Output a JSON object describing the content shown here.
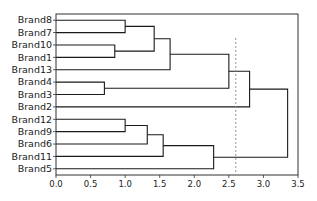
{
  "chart_data": {
    "type": "dendrogram",
    "title": "",
    "xlabel": "",
    "ylabel": "",
    "orientation": "left",
    "xlim": [
      0.0,
      3.5
    ],
    "xticks": [
      "0.0",
      "0.5",
      "1.0",
      "1.5",
      "2.0",
      "2.5",
      "3.0",
      "3.5"
    ],
    "leaves": [
      "Brand8",
      "Brand7",
      "Brand10",
      "Brand1",
      "Brand13",
      "Brand4",
      "Brand3",
      "Brand2",
      "Brand12",
      "Brand9",
      "Brand6",
      "Brand11",
      "Brand5"
    ],
    "merges": [
      {
        "left": "Brand8",
        "right": "Brand7",
        "height": 1.0
      },
      {
        "left": "Brand10",
        "right": "Brand1",
        "height": 0.85
      },
      {
        "left": "(Brand8,Brand7)",
        "right": "(Brand10,Brand1)",
        "height": 1.42
      },
      {
        "left": "(Brand8,Brand7,Brand10,Brand1)",
        "right": "Brand13",
        "height": 1.65
      },
      {
        "left": "Brand4",
        "right": "Brand3",
        "height": 0.7
      },
      {
        "left": "(Brand8..Brand13)",
        "right": "(Brand4,Brand3)",
        "height": 2.5
      },
      {
        "left": "(Brand8..Brand3)",
        "right": "Brand2",
        "height": 2.8
      },
      {
        "left": "Brand12",
        "right": "Brand9",
        "height": 1.0
      },
      {
        "left": "(Brand12,Brand9)",
        "right": "Brand6",
        "height": 1.32
      },
      {
        "left": "(Brand12,Brand9,Brand6)",
        "right": "Brand11",
        "height": 1.55
      },
      {
        "left": "(Brand12..Brand11)",
        "right": "Brand5",
        "height": 2.28
      },
      {
        "left": "(Brand8..Brand2)",
        "right": "(Brand12..Brand5)",
        "height": 3.35
      }
    ],
    "threshold_line": {
      "x": 2.6,
      "style": "dashed"
    },
    "grid": false,
    "colors": {
      "link": "#1a1a1a",
      "threshold": "#888888",
      "axes": "#333333"
    }
  }
}
